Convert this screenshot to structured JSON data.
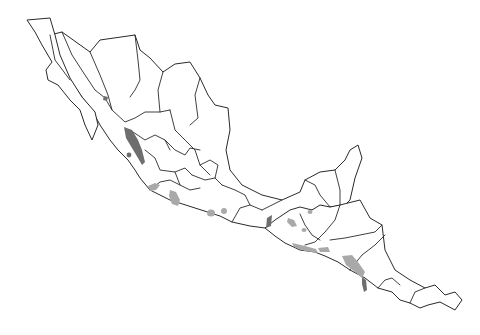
{
  "map": {
    "region": "Mexico and Central America",
    "type": "species distribution map",
    "colors": {
      "background": "#ffffff",
      "outline": "#2a2a2a",
      "distribution_light": "#a9a9a9",
      "distribution_dark": "#6e6e6e"
    },
    "distribution_areas": [
      {
        "name": "Sinaloa-Nayarit Pacific coast",
        "shade": "dark"
      },
      {
        "name": "Islas Marias point",
        "shade": "dark"
      },
      {
        "name": "Sonora small patch",
        "shade": "dark"
      },
      {
        "name": "Jalisco coast",
        "shade": "light"
      },
      {
        "name": "Michoacan patch",
        "shade": "light"
      },
      {
        "name": "Guerrero patches",
        "shade": "light"
      },
      {
        "name": "Chiapas Pacific coast",
        "shade": "dark"
      },
      {
        "name": "Guatemala highlands patches",
        "shade": "light"
      },
      {
        "name": "Guatemala-El Salvador coast",
        "shade": "light"
      },
      {
        "name": "Nicaragua Pacific region",
        "shade": "light"
      },
      {
        "name": "Costa Rica Nicoya",
        "shade": "dark"
      }
    ]
  }
}
